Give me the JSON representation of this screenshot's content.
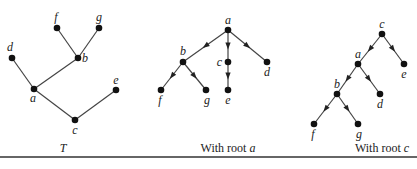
{
  "figures": [
    {
      "id": "T",
      "caption": "T",
      "caption_italic": true,
      "directed": false,
      "nodes": [
        {
          "id": "f",
          "label": "f"
        },
        {
          "id": "g",
          "label": "g"
        },
        {
          "id": "d",
          "label": "d"
        },
        {
          "id": "b",
          "label": "b"
        },
        {
          "id": "a",
          "label": "a"
        },
        {
          "id": "e",
          "label": "e"
        },
        {
          "id": "c",
          "label": "c"
        }
      ],
      "edges": [
        [
          "b",
          "f"
        ],
        [
          "b",
          "g"
        ],
        [
          "a",
          "d"
        ],
        [
          "a",
          "b"
        ],
        [
          "a",
          "c"
        ],
        [
          "c",
          "e"
        ]
      ]
    },
    {
      "id": "root-a",
      "caption_prefix": "With root ",
      "caption_var": "a",
      "directed": true,
      "root": "a",
      "nodes": [
        {
          "id": "a",
          "label": "a"
        },
        {
          "id": "b",
          "label": "b"
        },
        {
          "id": "c",
          "label": "c"
        },
        {
          "id": "d",
          "label": "d"
        },
        {
          "id": "f",
          "label": "f"
        },
        {
          "id": "g",
          "label": "g"
        },
        {
          "id": "e",
          "label": "e"
        }
      ],
      "edges": [
        [
          "a",
          "b"
        ],
        [
          "a",
          "c"
        ],
        [
          "a",
          "d"
        ],
        [
          "b",
          "f"
        ],
        [
          "b",
          "g"
        ],
        [
          "c",
          "e"
        ]
      ]
    },
    {
      "id": "root-c",
      "caption_prefix": "With root ",
      "caption_var": "c",
      "directed": true,
      "root": "c",
      "nodes": [
        {
          "id": "c",
          "label": "c"
        },
        {
          "id": "a",
          "label": "a"
        },
        {
          "id": "e",
          "label": "e"
        },
        {
          "id": "b",
          "label": "b"
        },
        {
          "id": "d",
          "label": "d"
        },
        {
          "id": "f",
          "label": "f"
        },
        {
          "id": "g",
          "label": "g"
        }
      ],
      "edges": [
        [
          "c",
          "a"
        ],
        [
          "c",
          "e"
        ],
        [
          "a",
          "b"
        ],
        [
          "a",
          "d"
        ],
        [
          "b",
          "f"
        ],
        [
          "b",
          "g"
        ]
      ]
    }
  ]
}
